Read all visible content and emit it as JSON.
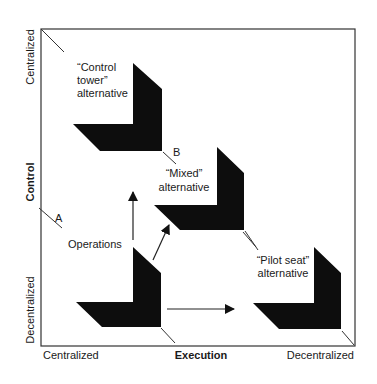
{
  "diagram": {
    "axes": {
      "x_title": "Execution",
      "x_low": "Centralized",
      "x_high": "Decentralized",
      "y_title": "Control",
      "y_high": "Centralized",
      "y_low": "Decentralized"
    },
    "markers": {
      "a": "A",
      "b": "B"
    },
    "alternatives": {
      "control_tower": {
        "line1": "“Control",
        "line2": "tower”",
        "line3": "alternative"
      },
      "mixed": {
        "line1": "“Mixed”",
        "line2": "alternative"
      },
      "pilot_seat": {
        "line1": "“Pilot seat”",
        "line2": "alternative"
      },
      "operations": {
        "label": "Operations"
      }
    },
    "colors": {
      "shape_fill": "#0d0d0d",
      "line": "#2a2a2a",
      "background": "#ffffff"
    }
  }
}
